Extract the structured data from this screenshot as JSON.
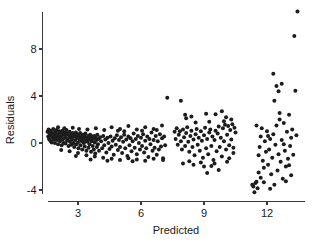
{
  "chart_data": {
    "type": "scatter",
    "title": "",
    "xlabel": "Predicted",
    "ylabel": "Residuals",
    "xlim": [
      1.2,
      13.6
    ],
    "ylim": [
      -4.6,
      11.4
    ],
    "xticks": [
      3,
      6,
      9,
      12
    ],
    "yticks": [
      -4,
      0,
      4,
      8
    ],
    "xtick_labels": [
      "3",
      "6",
      "9",
      "12"
    ],
    "ytick_labels": [
      "-4",
      "0",
      "4",
      "8"
    ],
    "grid": false,
    "legend": null,
    "marker": "filled-circle",
    "marker_color": "#1c1c1c",
    "marker_size": 2.0,
    "axis_color": "#3a3a3a",
    "background": "#ffffff",
    "points": [
      [
        1.55,
        0.95
      ],
      [
        1.58,
        0.55
      ],
      [
        1.6,
        1.15
      ],
      [
        1.62,
        0.35
      ],
      [
        1.65,
        0.8
      ],
      [
        1.68,
        0.2
      ],
      [
        1.7,
        1.05
      ],
      [
        1.72,
        0.6
      ],
      [
        1.75,
        0.05
      ],
      [
        1.78,
        0.85
      ],
      [
        1.8,
        0.45
      ],
      [
        1.82,
        1.2
      ],
      [
        1.85,
        0.3
      ],
      [
        1.88,
        0.7
      ],
      [
        1.9,
        0.0
      ],
      [
        1.92,
        0.95
      ],
      [
        1.95,
        0.5
      ],
      [
        1.98,
        1.1
      ],
      [
        2.0,
        0.25
      ],
      [
        2.02,
        0.75
      ],
      [
        2.05,
        -0.1
      ],
      [
        2.08,
        0.6
      ],
      [
        2.1,
        1.0
      ],
      [
        2.12,
        0.4
      ],
      [
        2.15,
        0.15
      ],
      [
        2.18,
        0.85
      ],
      [
        2.2,
        0.55
      ],
      [
        2.22,
        -0.2
      ],
      [
        2.25,
        1.05
      ],
      [
        2.28,
        0.3
      ],
      [
        2.3,
        0.7
      ],
      [
        2.32,
        0.0
      ],
      [
        2.35,
        0.9
      ],
      [
        2.38,
        0.45
      ],
      [
        2.4,
        -0.05
      ],
      [
        2.42,
        0.65
      ],
      [
        2.45,
        1.1
      ],
      [
        2.48,
        0.2
      ],
      [
        2.5,
        0.8
      ],
      [
        2.52,
        0.35
      ],
      [
        2.55,
        -0.25
      ],
      [
        2.58,
        0.6
      ],
      [
        2.6,
        0.95
      ],
      [
        2.62,
        0.1
      ],
      [
        2.65,
        0.5
      ],
      [
        2.68,
        -0.15
      ],
      [
        2.7,
        0.75
      ],
      [
        2.72,
        0.3
      ],
      [
        2.75,
        0.85
      ],
      [
        2.78,
        0.0
      ],
      [
        2.8,
        0.55
      ],
      [
        2.82,
        -0.35
      ],
      [
        2.85,
        0.65
      ],
      [
        2.88,
        0.25
      ],
      [
        2.9,
        0.9
      ],
      [
        2.92,
        -0.1
      ],
      [
        2.95,
        0.45
      ],
      [
        2.98,
        0.7
      ],
      [
        3.0,
        0.05
      ],
      [
        3.02,
        -0.45
      ],
      [
        3.05,
        0.6
      ],
      [
        3.08,
        0.3
      ],
      [
        3.1,
        0.85
      ],
      [
        3.12,
        -0.2
      ],
      [
        3.15,
        0.5
      ],
      [
        3.18,
        0.15
      ],
      [
        3.2,
        -0.55
      ],
      [
        3.22,
        0.7
      ],
      [
        3.25,
        0.35
      ],
      [
        3.28,
        0.0
      ],
      [
        3.3,
        0.55
      ],
      [
        3.32,
        -0.3
      ],
      [
        3.35,
        0.8
      ],
      [
        3.38,
        0.2
      ],
      [
        3.4,
        -0.65
      ],
      [
        3.42,
        0.45
      ],
      [
        3.45,
        0.1
      ],
      [
        3.48,
        0.6
      ],
      [
        3.5,
        -0.4
      ],
      [
        3.52,
        0.3
      ],
      [
        3.55,
        -0.1
      ],
      [
        3.58,
        0.7
      ],
      [
        3.6,
        0.4
      ],
      [
        3.62,
        -0.75
      ],
      [
        3.65,
        0.15
      ],
      [
        3.68,
        0.55
      ],
      [
        3.7,
        -0.25
      ],
      [
        3.72,
        0.35
      ],
      [
        3.75,
        -0.55
      ],
      [
        3.78,
        0.6
      ],
      [
        3.8,
        0.05
      ],
      [
        3.82,
        -0.9
      ],
      [
        3.85,
        0.45
      ],
      [
        3.88,
        0.25
      ],
      [
        3.9,
        -0.35
      ],
      [
        3.92,
        0.7
      ],
      [
        3.95,
        -0.1
      ],
      [
        3.98,
        0.35
      ],
      [
        4.0,
        -0.65
      ],
      [
        4.05,
        0.5
      ],
      [
        4.1,
        0.15
      ],
      [
        4.15,
        -0.45
      ],
      [
        4.2,
        0.6
      ],
      [
        4.25,
        -0.2
      ],
      [
        4.3,
        0.3
      ],
      [
        4.35,
        -0.8
      ],
      [
        4.4,
        0.45
      ],
      [
        4.45,
        0.0
      ],
      [
        4.5,
        -0.5
      ],
      [
        4.55,
        0.55
      ],
      [
        4.6,
        -0.3
      ],
      [
        4.65,
        0.2
      ],
      [
        4.7,
        -1.0
      ],
      [
        4.75,
        0.4
      ],
      [
        4.8,
        -0.15
      ],
      [
        4.85,
        0.65
      ],
      [
        4.9,
        -0.6
      ],
      [
        4.95,
        0.25
      ],
      [
        5.0,
        -0.35
      ],
      [
        5.05,
        0.5
      ],
      [
        5.1,
        -0.85
      ],
      [
        5.15,
        0.1
      ],
      [
        5.2,
        0.7
      ],
      [
        5.25,
        -0.45
      ],
      [
        5.3,
        0.3
      ],
      [
        5.35,
        -1.1
      ],
      [
        5.4,
        0.55
      ],
      [
        5.45,
        -0.2
      ],
      [
        5.5,
        0.4
      ],
      [
        5.55,
        -0.7
      ],
      [
        5.6,
        0.15
      ],
      [
        5.65,
        0.8
      ],
      [
        5.7,
        -0.4
      ],
      [
        5.75,
        0.35
      ],
      [
        5.8,
        -0.95
      ],
      [
        5.85,
        0.6
      ],
      [
        5.9,
        0.0
      ],
      [
        5.95,
        -0.55
      ],
      [
        6.0,
        0.45
      ],
      [
        6.05,
        -0.25
      ],
      [
        6.1,
        0.75
      ],
      [
        6.15,
        -0.8
      ],
      [
        6.2,
        0.2
      ],
      [
        6.25,
        -0.45
      ],
      [
        6.3,
        0.55
      ],
      [
        6.35,
        -1.2
      ],
      [
        6.4,
        0.35
      ],
      [
        6.45,
        -0.1
      ],
      [
        6.5,
        0.9
      ],
      [
        6.55,
        -0.65
      ],
      [
        6.6,
        0.25
      ],
      [
        6.65,
        -0.4
      ],
      [
        6.7,
        0.6
      ],
      [
        6.75,
        -1.0
      ],
      [
        6.8,
        0.15
      ],
      [
        6.85,
        -0.55
      ],
      [
        6.9,
        0.75
      ],
      [
        6.95,
        -0.3
      ],
      [
        7.0,
        0.4
      ],
      [
        7.05,
        -1.3
      ],
      [
        7.1,
        0.55
      ],
      [
        7.15,
        -0.2
      ],
      [
        2.05,
        1.35
      ],
      [
        2.35,
        1.25
      ],
      [
        2.75,
        1.3
      ],
      [
        3.05,
        1.2
      ],
      [
        3.45,
        1.15
      ],
      [
        3.85,
        1.25
      ],
      [
        4.25,
        1.1
      ],
      [
        4.6,
        1.35
      ],
      [
        5.0,
        1.2
      ],
      [
        5.4,
        1.45
      ],
      [
        5.8,
        1.15
      ],
      [
        6.2,
        1.35
      ],
      [
        6.6,
        1.2
      ],
      [
        7.0,
        1.5
      ],
      [
        4.9,
        1.05
      ],
      [
        5.2,
        1.0
      ],
      [
        6.05,
        1.05
      ],
      [
        6.75,
        1.1
      ],
      [
        2.2,
        -0.6
      ],
      [
        2.6,
        -0.7
      ],
      [
        3.0,
        -0.85
      ],
      [
        3.4,
        -1.05
      ],
      [
        3.8,
        -1.15
      ],
      [
        4.2,
        -1.25
      ],
      [
        4.6,
        -1.35
      ],
      [
        5.0,
        -1.45
      ],
      [
        5.4,
        -1.3
      ],
      [
        5.8,
        -1.4
      ],
      [
        6.2,
        -1.5
      ],
      [
        6.6,
        -1.35
      ],
      [
        7.05,
        -1.45
      ],
      [
        4.4,
        -1.5
      ],
      [
        3.6,
        -1.4
      ],
      [
        2.9,
        -1.1
      ],
      [
        5.6,
        -1.55
      ],
      [
        7.25,
        3.85
      ],
      [
        7.6,
        0.95
      ],
      [
        7.65,
        0.35
      ],
      [
        7.7,
        1.25
      ],
      [
        7.75,
        -0.15
      ],
      [
        7.8,
        0.7
      ],
      [
        7.85,
        1.0
      ],
      [
        7.9,
        0.15
      ],
      [
        7.95,
        -0.55
      ],
      [
        8.0,
        1.15
      ],
      [
        8.05,
        0.5
      ],
      [
        8.1,
        -0.25
      ],
      [
        8.15,
        0.85
      ],
      [
        8.2,
        1.35
      ],
      [
        8.25,
        0.1
      ],
      [
        8.3,
        -0.75
      ],
      [
        8.35,
        0.6
      ],
      [
        8.4,
        1.05
      ],
      [
        8.45,
        -0.35
      ],
      [
        8.5,
        0.3
      ],
      [
        8.55,
        -1.05
      ],
      [
        8.6,
        0.75
      ],
      [
        8.65,
        1.2
      ],
      [
        8.7,
        -0.15
      ],
      [
        8.75,
        0.45
      ],
      [
        8.8,
        -0.65
      ],
      [
        8.85,
        1.0
      ],
      [
        8.9,
        0.2
      ],
      [
        8.95,
        -1.25
      ],
      [
        9.0,
        0.65
      ],
      [
        9.05,
        1.3
      ],
      [
        9.1,
        -0.45
      ],
      [
        9.15,
        0.35
      ],
      [
        9.2,
        -0.95
      ],
      [
        9.25,
        0.9
      ],
      [
        9.3,
        1.15
      ],
      [
        9.35,
        -0.25
      ],
      [
        9.4,
        0.55
      ],
      [
        9.45,
        -1.45
      ],
      [
        9.5,
        0.25
      ],
      [
        9.55,
        1.05
      ],
      [
        9.6,
        -0.7
      ],
      [
        9.65,
        0.8
      ],
      [
        9.7,
        1.4
      ],
      [
        9.75,
        -0.35
      ],
      [
        9.8,
        0.45
      ],
      [
        9.85,
        -1.15
      ],
      [
        9.9,
        1.25
      ],
      [
        9.95,
        0.15
      ],
      [
        10.0,
        1.55
      ],
      [
        10.05,
        -0.55
      ],
      [
        10.1,
        0.7
      ],
      [
        10.15,
        1.45
      ],
      [
        10.2,
        -0.2
      ],
      [
        10.25,
        1.1
      ],
      [
        10.3,
        0.3
      ],
      [
        10.35,
        1.6
      ],
      [
        10.4,
        -0.85
      ],
      [
        10.45,
        1.3
      ],
      [
        7.9,
        3.6
      ],
      [
        8.1,
        2.4
      ],
      [
        8.15,
        2.1
      ],
      [
        8.4,
        2.25
      ],
      [
        9.1,
        2.5
      ],
      [
        9.55,
        2.45
      ],
      [
        9.85,
        2.7
      ],
      [
        10.05,
        2.2
      ],
      [
        10.3,
        2.0
      ],
      [
        8.6,
        1.75
      ],
      [
        9.25,
        1.8
      ],
      [
        9.95,
        1.85
      ],
      [
        8.0,
        -1.75
      ],
      [
        8.5,
        -1.85
      ],
      [
        9.0,
        -2.0
      ],
      [
        9.35,
        -1.95
      ],
      [
        9.7,
        -2.3
      ],
      [
        8.3,
        -1.55
      ],
      [
        8.85,
        -1.65
      ],
      [
        9.5,
        -1.75
      ],
      [
        10.1,
        -1.6
      ],
      [
        9.15,
        -2.55
      ],
      [
        10.2,
        -1.3
      ],
      [
        10.4,
        -0.4
      ],
      [
        10.5,
        0.9
      ],
      [
        11.3,
        -3.55
      ],
      [
        11.35,
        -3.7
      ],
      [
        11.4,
        -4.2
      ],
      [
        11.45,
        -3.4
      ],
      [
        11.5,
        -3.3
      ],
      [
        11.55,
        -3.85
      ],
      [
        11.6,
        -1.05
      ],
      [
        11.65,
        -0.35
      ],
      [
        11.7,
        0.55
      ],
      [
        11.75,
        1.25
      ],
      [
        11.8,
        -1.5
      ],
      [
        11.85,
        -2.1
      ],
      [
        11.9,
        0.15
      ],
      [
        11.95,
        -0.75
      ],
      [
        12.0,
        1.0
      ],
      [
        12.05,
        -1.85
      ],
      [
        12.1,
        -0.55
      ],
      [
        12.15,
        0.35
      ],
      [
        12.2,
        -2.65
      ],
      [
        12.25,
        -1.25
      ],
      [
        12.3,
        0.75
      ],
      [
        12.35,
        -3.55
      ],
      [
        12.4,
        -0.15
      ],
      [
        12.45,
        1.5
      ],
      [
        12.5,
        -2.35
      ],
      [
        12.55,
        -0.95
      ],
      [
        12.6,
        2.0
      ],
      [
        12.65,
        -1.6
      ],
      [
        12.7,
        0.25
      ],
      [
        12.75,
        -3.05
      ],
      [
        12.8,
        1.7
      ],
      [
        12.85,
        -0.65
      ],
      [
        12.9,
        -2.0
      ],
      [
        12.95,
        0.95
      ],
      [
        13.0,
        -1.35
      ],
      [
        13.05,
        2.4
      ],
      [
        13.1,
        -0.25
      ],
      [
        13.15,
        -2.75
      ],
      [
        13.2,
        1.15
      ],
      [
        13.25,
        -1.0
      ],
      [
        12.3,
        5.9
      ],
      [
        12.45,
        4.85
      ],
      [
        12.55,
        4.4
      ],
      [
        12.35,
        3.6
      ],
      [
        12.6,
        2.55
      ],
      [
        12.7,
        5.05
      ],
      [
        13.3,
        9.1
      ],
      [
        13.45,
        11.2
      ],
      [
        13.35,
        4.45
      ],
      [
        13.4,
        0.65
      ],
      [
        11.7,
        -2.95
      ],
      [
        11.85,
        -3.35
      ],
      [
        12.15,
        -3.9
      ],
      [
        12.9,
        -3.25
      ],
      [
        13.05,
        -1.9
      ],
      [
        11.5,
        1.5
      ],
      [
        11.6,
        -2.5
      ],
      [
        12.05,
        0.6
      ],
      [
        12.8,
        -0.1
      ],
      [
        13.15,
        0.45
      ]
    ]
  }
}
